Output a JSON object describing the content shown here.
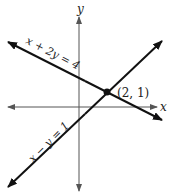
{
  "diagram": {
    "type": "coordinate-plane",
    "axes": {
      "x_label": "x",
      "y_label": "y"
    },
    "lines": [
      {
        "equation": "x + 2y = 4",
        "label": "x + 2y = 4"
      },
      {
        "equation": "x − y = 1",
        "label": "x − y = 1"
      }
    ],
    "intersection": {
      "label": "(2, 1)",
      "x": 2,
      "y": 1
    },
    "colors": {
      "axis": "#555555",
      "line": "#111111",
      "text": "#222222"
    }
  }
}
